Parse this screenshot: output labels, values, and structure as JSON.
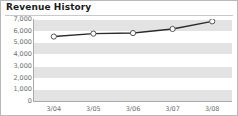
{
  "widget": {
    "title": "Revenue History"
  },
  "chart_data": {
    "type": "line",
    "title": "Revenue History",
    "xlabel": "",
    "ylabel": "",
    "categories": [
      "3/04",
      "3/05",
      "3/06",
      "3/07",
      "3/08"
    ],
    "values": [
      5500,
      5750,
      5800,
      6150,
      6800
    ],
    "series": [
      {
        "name": "Revenue",
        "values": [
          5500,
          5750,
          5800,
          6150,
          6800
        ]
      }
    ],
    "ylim": [
      0,
      7000
    ],
    "ytick_step": 1000,
    "ytick_labels": [
      "7,000",
      "6,000",
      "5,000",
      "4,000",
      "3,000",
      "2,000",
      "1,000",
      "0"
    ],
    "ytick_values": [
      7000,
      6000,
      5000,
      4000,
      3000,
      2000,
      1000,
      0
    ],
    "xtick_labels": [
      "3/04",
      "3/05",
      "3/06",
      "3/07",
      "3/08"
    ],
    "grid": true,
    "grid_style": "alternating-horizontal-bands",
    "legend": null,
    "legend_position": "none",
    "colors": {
      "line": "#2b2b2b",
      "marker_fill": "#ffffff",
      "marker_stroke": "#555555",
      "band": "#e3e3e3",
      "gridline": "#ffffff",
      "axis": "#aaaaaa",
      "tick_text": "#6e6e6e",
      "title_text": "#1b1b1b",
      "border": "#b9b9b9",
      "background": "#ffffff"
    }
  }
}
